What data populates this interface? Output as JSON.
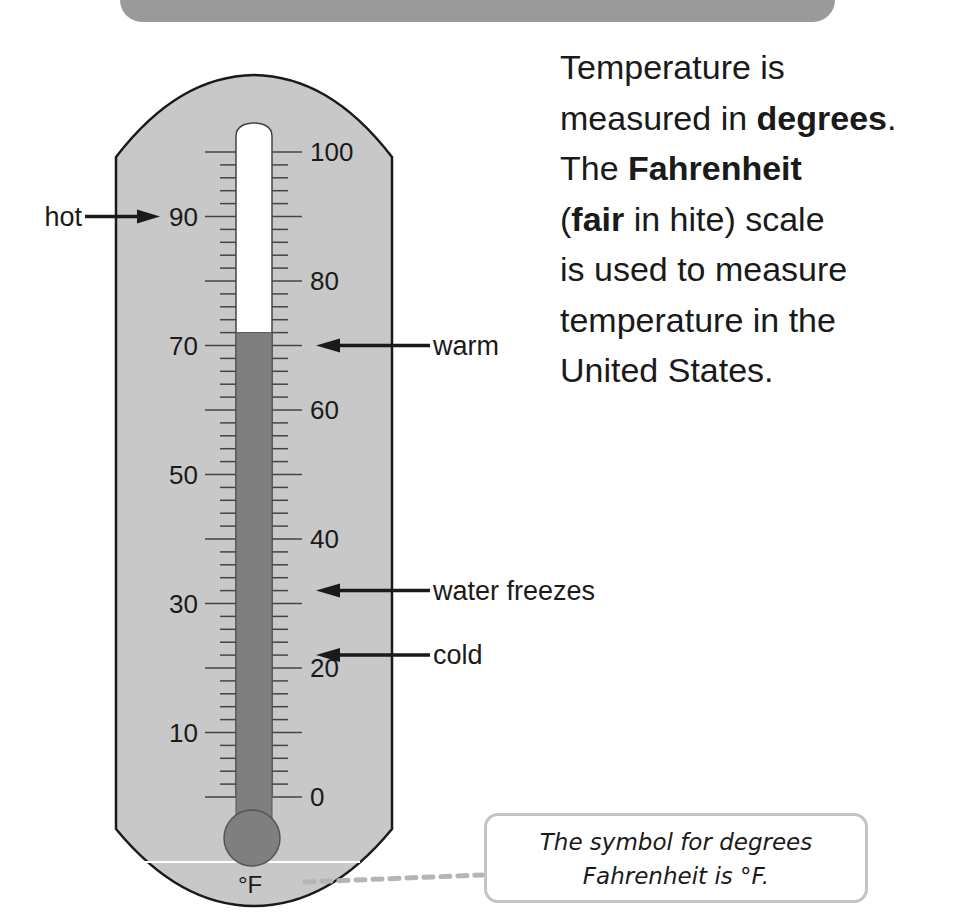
{
  "banner": {
    "title": "Fahrenheit",
    "color": "#9a9a9a"
  },
  "body_text": {
    "lines": [
      {
        "parts": [
          {
            "text": "Temperature is",
            "bold": false
          }
        ]
      },
      {
        "parts": [
          {
            "text": "measured in ",
            "bold": false
          },
          {
            "text": "degrees",
            "bold": true
          },
          {
            "text": ".",
            "bold": false
          }
        ]
      },
      {
        "parts": [
          {
            "text": "The ",
            "bold": false
          },
          {
            "text": "Fahrenheit",
            "bold": true
          }
        ]
      },
      {
        "parts": [
          {
            "text": "(",
            "bold": false
          },
          {
            "text": "fair",
            "bold": true
          },
          {
            "text": " in hite) scale",
            "bold": false
          }
        ]
      },
      {
        "parts": [
          {
            "text": "is used to measure",
            "bold": false
          }
        ]
      },
      {
        "parts": [
          {
            "text": "temperature in the",
            "bold": false
          }
        ]
      },
      {
        "parts": [
          {
            "text": "United States.",
            "bold": false
          }
        ]
      }
    ]
  },
  "thermometer": {
    "unit": "°F",
    "min": 0,
    "max": 100,
    "reading": 72,
    "body_color": "#c8c8c8",
    "fill_color": "#7f7f7f",
    "left_labels": [
      "90",
      "70",
      "50",
      "30",
      "10"
    ],
    "left_values": [
      90,
      70,
      50,
      30,
      10
    ],
    "right_labels": [
      "100",
      "80",
      "60",
      "40",
      "20",
      "0"
    ],
    "right_values": [
      100,
      80,
      60,
      40,
      20,
      0
    ]
  },
  "annotations": [
    {
      "label": "hot",
      "value": 90,
      "side": "left"
    },
    {
      "label": "warm",
      "value": 70,
      "side": "right"
    },
    {
      "label": "water freezes",
      "value": 32,
      "side": "right"
    },
    {
      "label": "cold",
      "value": 22,
      "side": "right"
    }
  ],
  "callout": {
    "line1": "The symbol for degrees",
    "line2": "Fahrenheit is °F."
  }
}
